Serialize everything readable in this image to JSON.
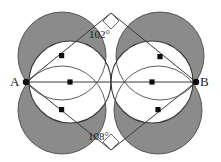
{
  "figure": {
    "type": "geometry-diagram",
    "points": [
      {
        "name": "A",
        "label": "A",
        "x": 26,
        "y": 82
      },
      {
        "name": "B",
        "label": "B",
        "x": 196,
        "y": 82
      }
    ],
    "angles": [
      {
        "name": "top-angle",
        "label": "102°",
        "value": 102,
        "x": 111,
        "y": 18
      },
      {
        "name": "bottom-angle",
        "label": "108°",
        "value": 108,
        "x": 111,
        "y": 146
      }
    ],
    "colors": {
      "shaded_fill": "#8b8b8b",
      "outline": "#3a3a3a",
      "stroke": "#5a5a5a",
      "background": "#ffffff",
      "dot": "#0d0d0d",
      "text": "#1b1b1b"
    },
    "main_circles": [
      {
        "name": "left-main-circle",
        "cx": 70,
        "cy": 82,
        "r": 41
      },
      {
        "name": "right-main-circle",
        "cx": 152,
        "cy": 82,
        "r": 41
      }
    ],
    "lune_circles": [
      {
        "name": "left-upper-lune",
        "cx": 62,
        "cy": 56,
        "r": 44
      },
      {
        "name": "left-lower-lune",
        "cx": 62,
        "cy": 110,
        "r": 44
      },
      {
        "name": "right-upper-lune",
        "cx": 160,
        "cy": 56,
        "r": 44
      },
      {
        "name": "right-lower-lune",
        "cx": 158,
        "cy": 110,
        "r": 44
      }
    ],
    "center_dots": [
      {
        "name": "dot-left-upper",
        "x": 62,
        "y": 56
      },
      {
        "name": "dot-left-center",
        "x": 70,
        "y": 82
      },
      {
        "name": "dot-left-lower",
        "x": 62,
        "y": 110
      },
      {
        "name": "dot-right-upper",
        "x": 160,
        "y": 57
      },
      {
        "name": "dot-right-center",
        "x": 152,
        "y": 82
      },
      {
        "name": "dot-right-lower",
        "x": 158,
        "y": 110
      }
    ],
    "vertex_markers": [
      {
        "name": "top-vertex",
        "x": 111,
        "y": 13
      },
      {
        "name": "bottom-vertex",
        "x": 111,
        "y": 150
      }
    ],
    "segments": [
      {
        "name": "segment-AB",
        "x1": 26,
        "y1": 82,
        "x2": 196,
        "y2": 82
      },
      {
        "name": "segment-A-top",
        "x1": 26,
        "y1": 82,
        "x2": 111,
        "y2": 13
      },
      {
        "name": "segment-top-B",
        "x1": 111,
        "y1": 13,
        "x2": 196,
        "y2": 82
      },
      {
        "name": "segment-A-bottom",
        "x1": 26,
        "y1": 82,
        "x2": 111,
        "y2": 150
      },
      {
        "name": "segment-bottom-B",
        "x1": 111,
        "y1": 150,
        "x2": 196,
        "y2": 82
      }
    ]
  }
}
